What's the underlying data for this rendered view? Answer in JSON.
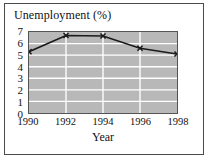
{
  "figure": {
    "background_color": "#ffffff",
    "frame_color": "#4a4a4a"
  },
  "chart_data": {
    "type": "line",
    "title": "Unemployment (%)",
    "xlabel": "Year",
    "ylabel": "",
    "categories": [
      "1990",
      "1992",
      "1994",
      "1996",
      "1998"
    ],
    "x": [
      1990,
      1992,
      1994,
      1996,
      1998
    ],
    "values": [
      5.3,
      6.7,
      6.65,
      5.6,
      5.1
    ],
    "xlim": [
      1990,
      1998
    ],
    "ylim": [
      0,
      7
    ],
    "ytick_labels": [
      "0",
      "1",
      "2",
      "3",
      "4",
      "5",
      "6",
      "7"
    ],
    "ytick_values": [
      0,
      1,
      2,
      3,
      4,
      5,
      6,
      7
    ],
    "xtick_labels": [
      "1990",
      "1992",
      "1994",
      "1996",
      "1998"
    ],
    "xtick_values": [
      1990,
      1992,
      1994,
      1996,
      1998
    ],
    "grid": true,
    "grid_color": "#ffffff",
    "plot_background": "#b8b8b8",
    "line_color": "#1a1a1a",
    "marker": "x",
    "legend": null,
    "legend_position": "none"
  }
}
